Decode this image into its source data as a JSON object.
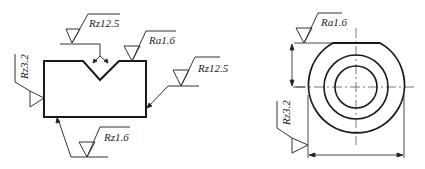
{
  "left_view": {
    "labels": {
      "notch": "Rz12.5",
      "top_right": "Ra1.6",
      "left_side": "Rz3.2",
      "right_side": "Rz12.5",
      "bottom": "Rz1.6"
    }
  },
  "right_view": {
    "labels": {
      "flat_top": "Ra1.6",
      "outer_diameter": "Rz3.2"
    }
  },
  "colors": {
    "line": "#1a1a1a",
    "thin": "#333333"
  }
}
